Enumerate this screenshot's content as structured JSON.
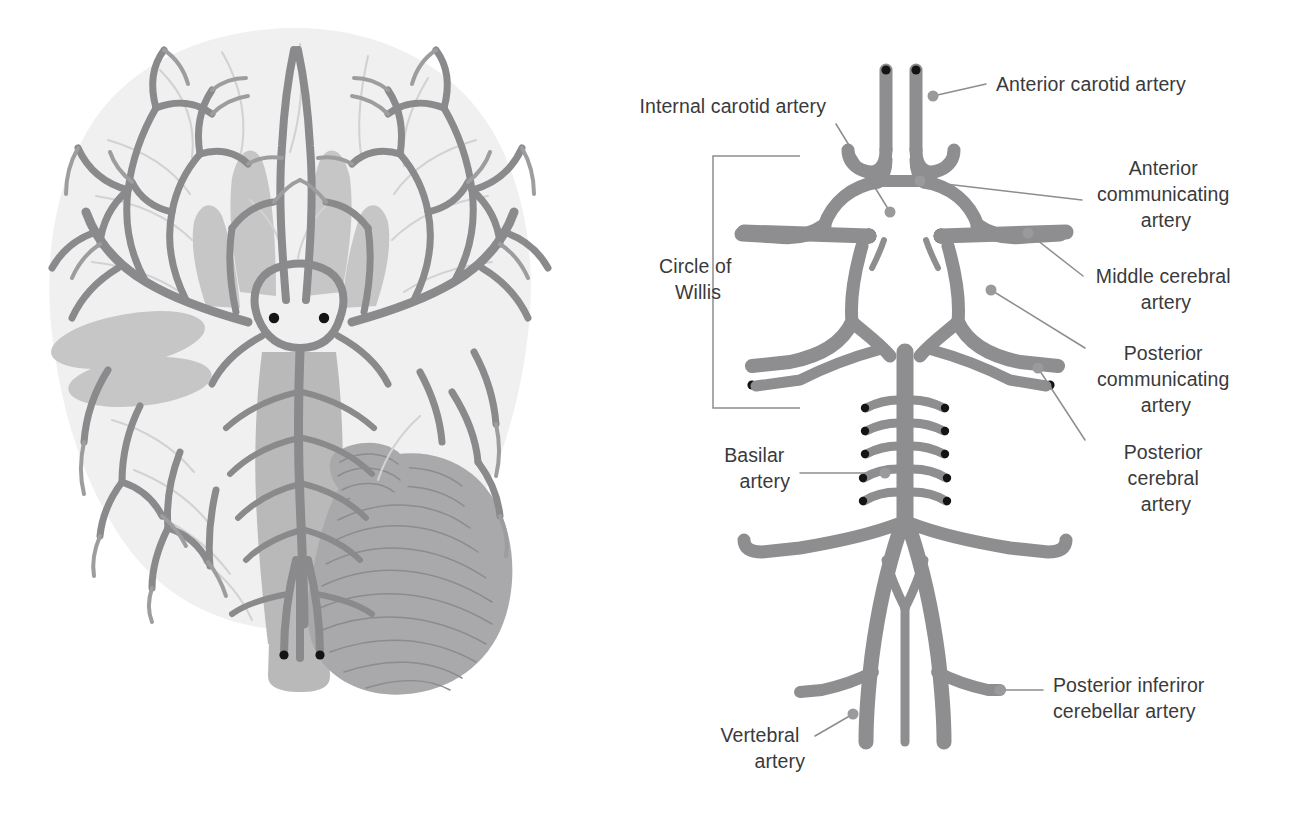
{
  "figure": {
    "panels": {
      "left": "Inferior view of the brain showing arterial supply",
      "right": "Schematic diagram of the arteries of the Circle of Willis"
    }
  },
  "colors": {
    "vessel": "#8e8e90",
    "lumen": "#141414",
    "leader": "#8d8d90",
    "text": "#3a3a3c",
    "brain_tissue": "#f0f0f0",
    "brain_midbrain": "#c6c6c6",
    "brainstem": "#b9b9b9",
    "cerebellum": "#a9a9ab",
    "background": "#ffffff"
  },
  "labels": [
    {
      "id": "internal-carotid-artery",
      "text": "Internal carotid artery",
      "lines": [
        "Internal carotid artery"
      ],
      "side": "left",
      "text_x": 826,
      "text_y": 113,
      "anchor": "end",
      "leader": {
        "x1": 836,
        "y1": 124,
        "x2": 890,
        "y2": 212
      },
      "dot": {
        "cx": 890,
        "cy": 212,
        "r": 5.5
      }
    },
    {
      "id": "anterior-carotid-artery",
      "text": "Anterior carotid artery",
      "lines": [
        "Anterior carotid artery"
      ],
      "side": "right",
      "text_x": 996,
      "text_y": 91,
      "anchor": "start",
      "leader": {
        "x1": 986,
        "y1": 84,
        "x2": 933,
        "y2": 96
      },
      "dot": {
        "cx": 933,
        "cy": 96,
        "r": 5.5
      }
    },
    {
      "id": "anterior-communicating-artery",
      "text": "Anterior communicating artery",
      "lines": [
        "Anterior",
        "communicating",
        "artery"
      ],
      "side": "right",
      "text_x": 1166,
      "text_y": 175,
      "anchor": "mid",
      "leader": {
        "x1": 1082,
        "y1": 200,
        "x2": 920,
        "y2": 181
      },
      "dot": {
        "cx": 920,
        "cy": 181,
        "r": 5.5
      }
    },
    {
      "id": "middle-cerebral-artery",
      "text": "Middle cerebral artery",
      "lines": [
        "Middle cerebral",
        "artery"
      ],
      "side": "right",
      "text_x": 1166,
      "text_y": 283,
      "anchor": "mid",
      "leader": {
        "x1": 1083,
        "y1": 276,
        "x2": 1028,
        "y2": 233
      },
      "dot": {
        "cx": 1028,
        "cy": 233,
        "r": 5.5
      }
    },
    {
      "id": "posterior-communicating-artery",
      "text": "Posterior communicating artery",
      "lines": [
        "Posterior",
        "communicating",
        "artery"
      ],
      "side": "right",
      "text_x": 1166,
      "text_y": 360,
      "anchor": "mid",
      "leader": {
        "x1": 1085,
        "y1": 348,
        "x2": 991,
        "y2": 290
      },
      "dot": {
        "cx": 991,
        "cy": 290,
        "r": 5.5
      }
    },
    {
      "id": "posterior-cerebral-artery",
      "text": "Posterior cerebral artery",
      "lines": [
        "Posterior",
        "cerebral",
        "artery"
      ],
      "side": "right",
      "text_x": 1166,
      "text_y": 459,
      "anchor": "mid",
      "leader": {
        "x1": 1085,
        "y1": 440,
        "x2": 1038,
        "y2": 368
      },
      "dot": {
        "cx": 1038,
        "cy": 368,
        "r": 5.5
      }
    },
    {
      "id": "posterior-inferior-cerebellar-artery",
      "text": "Posterior inferiror cerebellar artery",
      "lines": [
        "Posterior inferiror",
        "cerebellar artery"
      ],
      "side": "right",
      "text_x": 1053,
      "text_y": 692,
      "anchor": "start",
      "leader": {
        "x1": 1043,
        "y1": 690,
        "x2": 1000,
        "y2": 690
      },
      "dot": {
        "cx": 1000,
        "cy": 690,
        "r": 5.5
      }
    },
    {
      "id": "basilar-artery",
      "text": "Basilar artery",
      "lines": [
        "Basilar",
        "artery"
      ],
      "side": "left",
      "text_x": 790,
      "text_y": 462,
      "anchor": "end",
      "leader": {
        "x1": 800,
        "y1": 473,
        "x2": 885,
        "y2": 473
      },
      "dot": {
        "cx": 885,
        "cy": 473,
        "r": 5.5
      }
    },
    {
      "id": "vertebral-artery",
      "text": "Vertebral artery",
      "lines": [
        "Vertebral",
        "artery"
      ],
      "side": "left",
      "text_x": 805,
      "text_y": 742,
      "anchor": "end",
      "leader": {
        "x1": 815,
        "y1": 736,
        "x2": 853,
        "y2": 714
      },
      "dot": {
        "cx": 853,
        "cy": 714,
        "r": 5.5
      }
    },
    {
      "id": "circle-of-willis",
      "text": "Circle of Willis",
      "lines": [
        "Circle of",
        "Willis"
      ],
      "side": "left",
      "text_x": 698,
      "text_y": 273,
      "anchor": "mid",
      "bracket": {
        "x_left": 713,
        "x_right": 800,
        "y_top": 156,
        "y_bottom": 408
      }
    }
  ],
  "basilar_branch_pairs": 5,
  "vessel_terminal_dots": 10
}
